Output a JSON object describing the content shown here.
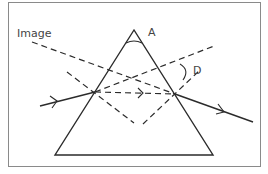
{
  "diagram": {
    "type": "prism-refraction",
    "labels": {
      "image": "Image",
      "apex_angle": "A",
      "deviation_angle": "D"
    },
    "colors": {
      "line": "#2b2b2b",
      "frame": "#8a8a8a",
      "text": "#444444",
      "background": "#ffffff"
    },
    "elements": [
      "prism (triangle)",
      "incident ray with arrow",
      "refracted ray inside prism (dashed) with arrow",
      "emergent ray with arrow",
      "normals at both faces (dashed)",
      "extended incident ray (dashed)",
      "image line back-projection (dashed)",
      "apex angle arc A",
      "deviation angle arc D"
    ]
  }
}
